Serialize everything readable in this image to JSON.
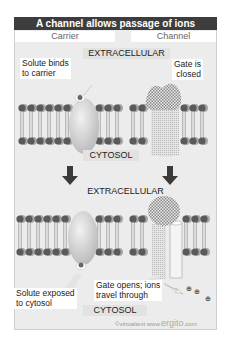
{
  "title": "A channel allows passage of ions",
  "columns": {
    "left": "Carrier",
    "right": "Channel"
  },
  "stage1": {
    "top_compartment": "EXTRACELLULAR",
    "bottom_compartment": "CYTOSOL",
    "carrier_callout": "Solute binds to carrier",
    "carrier_callout_lines": [
      "Solute binds",
      "to carrier"
    ],
    "channel_callout_lines": [
      "Gate is",
      "closed"
    ]
  },
  "stage2": {
    "top_compartment": "EXTRACELLULAR",
    "bottom_compartment": "CYTOSOL",
    "carrier_callout_lines": [
      "Solute exposed",
      "to cytosol"
    ],
    "channel_callout_lines": [
      "Gate opens; ions",
      "travel through"
    ]
  },
  "ions": [
    "⊕",
    "⊕",
    "⊕"
  ],
  "footer": {
    "credit": "©virtualtext www.",
    "brand": "ergito",
    "suffix": ".com"
  },
  "colors": {
    "title_bg": "#3d3d3d",
    "panel_bg": "#ececec",
    "lipid_head": "#5a5a5a",
    "lipid_head_shadow": "#a8a8a8",
    "carrier": "#d4d4d4",
    "channel_gate": "#bdbdbd"
  }
}
